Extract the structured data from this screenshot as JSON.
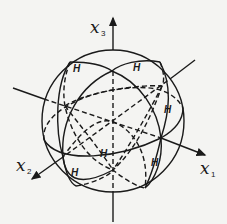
{
  "figure": {
    "type": "sphere-with-great-circles",
    "colors": {
      "ink": "#1a1a1a",
      "paper": "#f4f4f2"
    },
    "axes": [
      {
        "id": "x1",
        "label": "x",
        "subscript": "1"
      },
      {
        "id": "x2",
        "label": "x",
        "subscript": "2"
      },
      {
        "id": "x3",
        "label": "x",
        "subscript": "3"
      }
    ],
    "region_labels": [
      "H",
      "H",
      "H",
      "H",
      "H",
      "H"
    ]
  }
}
